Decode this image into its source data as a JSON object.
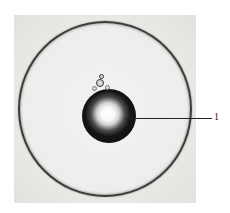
{
  "figure": {
    "type": "micrograph",
    "annotations": [
      {
        "label": "1",
        "target": "inner-droplet"
      }
    ]
  }
}
